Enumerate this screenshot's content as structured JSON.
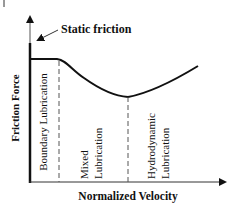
{
  "diagram": {
    "type": "friction-stribeck-curve",
    "static_friction_label": "Static friction",
    "y_axis_label": "Friction Force",
    "x_axis_label": "Normalized Velocity",
    "regions": [
      {
        "lines": [
          "Boundary Lubrication"
        ]
      },
      {
        "lines": [
          "Mixed",
          "Lubrication"
        ]
      },
      {
        "lines": [
          "Hydrodynamic",
          "Lubrication"
        ]
      }
    ],
    "colors": {
      "ink": "#111111",
      "background": "#ffffff"
    }
  }
}
